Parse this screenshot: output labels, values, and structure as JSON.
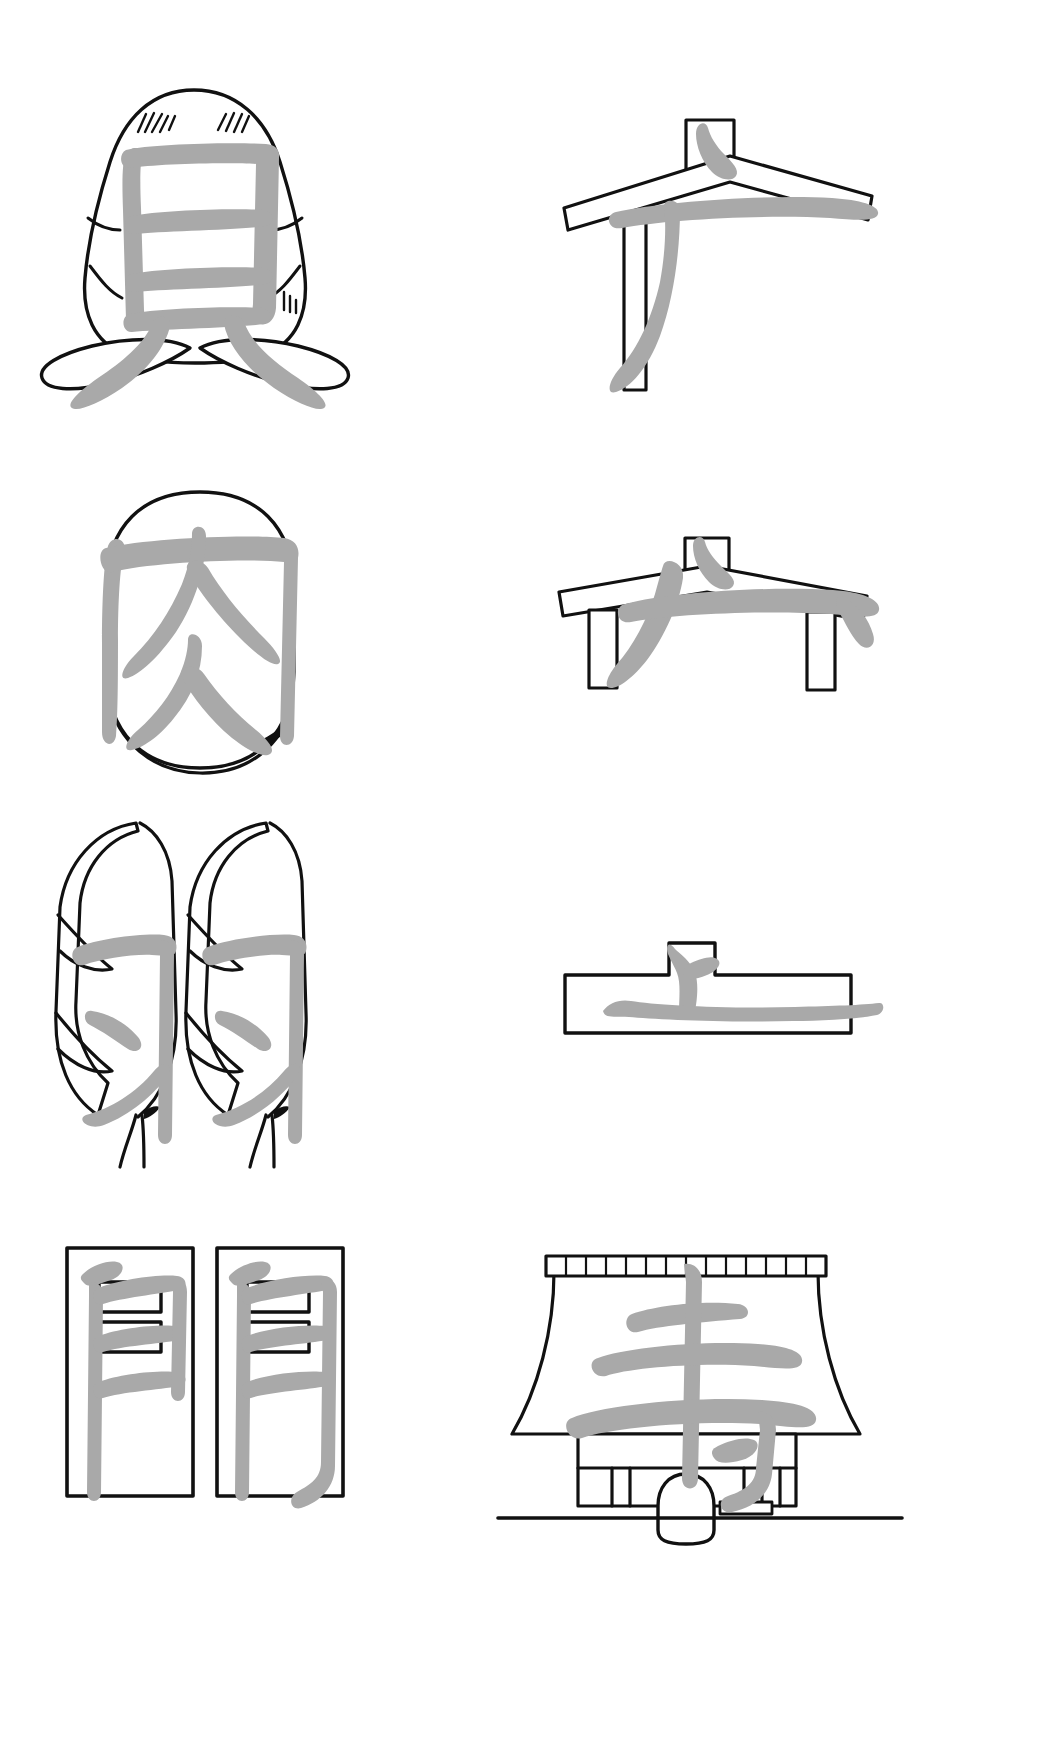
{
  "page": {
    "background_color": "#ffffff",
    "kanji_stroke_color": "#a9a9a9",
    "artwork_line_color": "#111111",
    "columns": 2,
    "rows": 4
  },
  "panels": [
    {
      "id": "panel-kai",
      "row": 1,
      "column": "left",
      "kanji": "貝",
      "meaning": "shell / shellfish",
      "pictograph": "cowrie-shell-with-two-protruding-feet",
      "pictograph_description": "A dome-shaped shell with ridged banding lines and short hatch marks, resting on two splayed foot shapes.",
      "stroke_count": 7
    },
    {
      "id": "panel-gen",
      "row": 1,
      "column": "right",
      "kanji": "广",
      "meaning": "lean-to shelter / building radical",
      "pictograph": "one-post-lean-to-roof",
      "pictograph_description": "A long sloping roof beam with a small ridge box on top, supported by a single vertical post on the left.",
      "stroke_count": 3
    },
    {
      "id": "panel-niku",
      "row": 2,
      "column": "left",
      "kanji": "肉",
      "meaning": "meat / flesh",
      "pictograph": "oval-slab-of-meat",
      "pictograph_description": "A rounded rectangular slab of meat drawn with a doubled contour at its base.",
      "stroke_count": 6
    },
    {
      "id": "panel-ukanmuri",
      "row": 2,
      "column": "right",
      "kanji": "宀",
      "meaning": "roof / house radical",
      "pictograph": "two-post-shelter-roof",
      "pictograph_description": "A shallow gabled roof with a small ridge box at the apex, supported by two short vertical posts.",
      "stroke_count": 3
    },
    {
      "id": "panel-hane",
      "row": 3,
      "column": "left",
      "kanji": "羽",
      "meaning": "feathers / wings",
      "pictograph": "pair-of-feathers",
      "pictograph_description": "Two symmetrical feathers with barbed edges and slender quills pointing downward.",
      "stroke_count": 6
    },
    {
      "id": "panel-ue",
      "row": 3,
      "column": "right",
      "kanji": "上",
      "meaning": "up / above",
      "pictograph": "baseline-with-marker-above",
      "pictograph_description": "A long horizontal bar with a small raised rectangular tab marking the position above the line.",
      "stroke_count": 3
    },
    {
      "id": "panel-mon",
      "row": 4,
      "column": "left",
      "kanji": "門",
      "meaning": "gate",
      "pictograph": "double-leaf-gate",
      "pictograph_description": "Two tall rectangular door leaves side by side, each divided into panels.",
      "stroke_count": 8
    },
    {
      "id": "panel-tera",
      "row": 4,
      "column": "right",
      "kanji": "寺",
      "meaning": "temple",
      "pictograph": "temple-bell-tower",
      "pictograph_description": "A temple belfry with a flared tiled roof, open pillared bay, a hanging bell, and a ground line.",
      "stroke_count": 6
    }
  ]
}
